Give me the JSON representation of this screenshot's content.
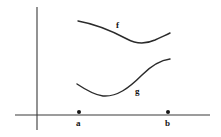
{
  "figure": {
    "background_color": "#ffffff",
    "ink_color": "#2b2b2b",
    "axis_color": "#3a3a3a",
    "width": 221,
    "height": 137
  },
  "axes": {
    "y_axis": {
      "name": "vertical-axis",
      "x": 37,
      "y_top": 7,
      "y_bottom": 130
    },
    "x_axis": {
      "name": "horizontal-axis",
      "y": 115,
      "x_left": 15,
      "x_right": 210
    },
    "origin": {
      "x": 37,
      "y": 115
    }
  },
  "labels": {
    "curve_f": "f",
    "curve_g": "g",
    "point_a": "a",
    "point_b": "b"
  },
  "marked_points": [
    {
      "label": "a",
      "x": 79,
      "y": 112,
      "radius": 2.0
    },
    {
      "label": "b",
      "x": 168,
      "y": 112,
      "radius": 2.0
    }
  ],
  "chart_data": {
    "type": "line",
    "xlabel": "",
    "ylabel": "",
    "grid": false,
    "legend": "inline-curve-labels",
    "axis_pixel_frame": {
      "x_axis_y": 115,
      "y_axis_x": 37,
      "note": "values below are pixel coordinates of the hand-drawn curves"
    },
    "interval": {
      "a": 79,
      "b": 168
    },
    "series": [
      {
        "name": "f",
        "label": "f",
        "label_position": {
          "x": 118,
          "y": 26
        },
        "path": "M 78 21 C 95 24, 112 31, 127 39 C 136 44, 146 44, 155 40 C 161 37, 166 35, 170 33",
        "points": [
          {
            "x": 78,
            "y": 21
          },
          {
            "x": 95,
            "y": 25
          },
          {
            "x": 110,
            "y": 31
          },
          {
            "x": 122,
            "y": 37
          },
          {
            "x": 132,
            "y": 41
          },
          {
            "x": 140,
            "y": 42
          },
          {
            "x": 150,
            "y": 40
          },
          {
            "x": 160,
            "y": 37
          },
          {
            "x": 170,
            "y": 33
          }
        ],
        "shape": "decreasing-then-increasing"
      },
      {
        "name": "g",
        "label": "g",
        "label_position": {
          "x": 137,
          "y": 92
        },
        "path": "M 77 84 C 86 90, 94 95, 103 96 C 117 97, 129 88, 142 75 C 152 65, 162 60, 170 59",
        "points": [
          {
            "x": 77,
            "y": 84
          },
          {
            "x": 86,
            "y": 90
          },
          {
            "x": 95,
            "y": 95
          },
          {
            "x": 103,
            "y": 96
          },
          {
            "x": 114,
            "y": 93
          },
          {
            "x": 126,
            "y": 86
          },
          {
            "x": 138,
            "y": 76
          },
          {
            "x": 152,
            "y": 65
          },
          {
            "x": 162,
            "y": 60
          },
          {
            "x": 170,
            "y": 59
          }
        ],
        "shape": "decreasing-then-increasing"
      }
    ]
  }
}
